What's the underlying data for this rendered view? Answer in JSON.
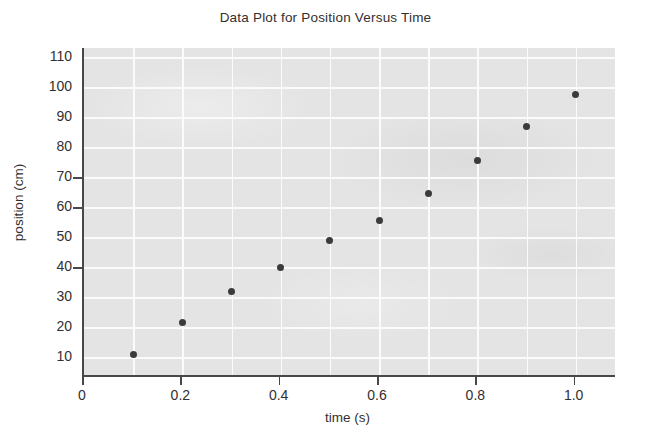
{
  "chart_data": {
    "type": "scatter",
    "title": "Data Plot for Position Versus Time",
    "xlabel": "time (s)",
    "ylabel": "position (cm)",
    "x": [
      0.1,
      0.2,
      0.3,
      0.4,
      0.5,
      0.6,
      0.7,
      0.8,
      0.9,
      1.0
    ],
    "values": [
      11,
      21.5,
      32,
      40,
      49,
      55.5,
      64.5,
      75.5,
      87,
      97.5
    ],
    "series": [
      {
        "name": "position",
        "values": [
          11,
          21.5,
          32,
          40,
          49,
          55.5,
          64.5,
          75.5,
          87,
          97.5
        ]
      }
    ],
    "xlim": [
      0,
      1.08
    ],
    "ylim": [
      4,
      113
    ],
    "xticks": [
      0,
      0.2,
      0.4,
      0.6,
      0.8,
      1.0
    ],
    "xtick_labels": [
      "0",
      "0.2",
      "0.4",
      "0.6",
      "0.8",
      "1.0"
    ],
    "yticks": [
      10,
      20,
      30,
      40,
      50,
      60,
      70,
      80,
      90,
      100,
      110
    ],
    "ytick_labels": [
      "10",
      "20",
      "30",
      "40",
      "50",
      "60",
      "70",
      "80",
      "90",
      "100",
      "110"
    ],
    "x_gridlines": [
      0.1,
      0.2,
      0.3,
      0.4,
      0.5,
      0.6,
      0.7,
      0.8,
      0.9,
      1.0
    ],
    "y_gridlines": [
      10,
      20,
      30,
      40,
      50,
      60,
      70,
      80,
      90,
      100,
      110
    ],
    "grid": true,
    "legend": false,
    "marker": "filled-circle",
    "colors": {
      "plot_background": "#e4e4e4",
      "gridline": "#fbfbfb",
      "axis": "#4a4748",
      "marker": "#3c3a3b",
      "text": "#332f30",
      "page_background": "#ffffff"
    }
  }
}
